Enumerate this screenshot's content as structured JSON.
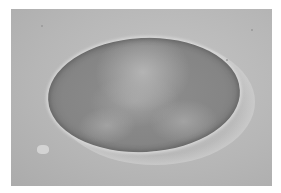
{
  "image": {
    "description": "Grayscale light micrograph of an oval, egg-shaped object with granular internal contents on a light gray background, with a small bright debris particle at lower left",
    "background_color": "#b8b8b8",
    "object_color": "#858585",
    "border_color": "#ffffff"
  }
}
